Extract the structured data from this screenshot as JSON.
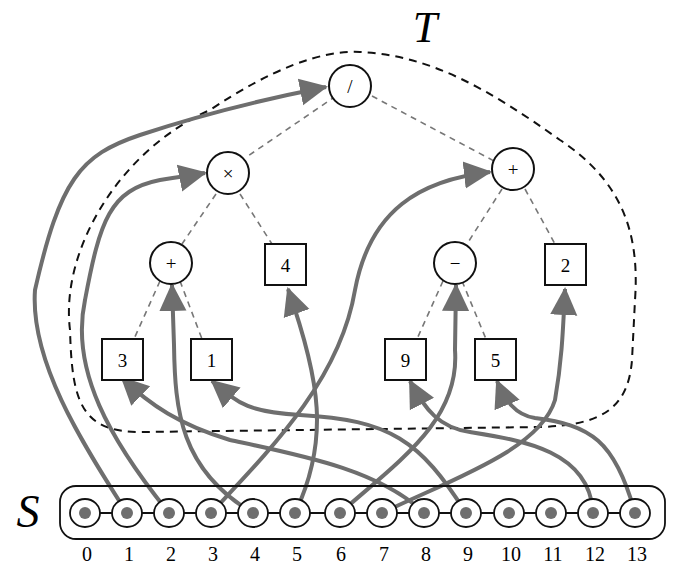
{
  "labels": {
    "tree": "T",
    "sequence": "S"
  },
  "colors": {
    "mapping_arrow": "#6e6e6e",
    "outline": "#111111",
    "tree_edge": "#777777"
  },
  "tree": {
    "root": {
      "symbol": "/",
      "type": "operator",
      "children": [
        "times",
        "plus_right"
      ]
    },
    "times": {
      "symbol": "×",
      "type": "operator",
      "children": [
        "plus_left",
        "leaf_4"
      ]
    },
    "plus_right": {
      "symbol": "+",
      "type": "operator",
      "children": [
        "minus",
        "leaf_2"
      ]
    },
    "plus_left": {
      "symbol": "+",
      "type": "operator",
      "children": [
        "leaf_3",
        "leaf_1"
      ]
    },
    "minus": {
      "symbol": "−",
      "type": "operator",
      "children": [
        "leaf_9",
        "leaf_5"
      ]
    },
    "leaf_4": {
      "symbol": "4",
      "type": "operand"
    },
    "leaf_2": {
      "symbol": "2",
      "type": "operand"
    },
    "leaf_3": {
      "symbol": "3",
      "type": "operand"
    },
    "leaf_1": {
      "symbol": "1",
      "type": "operand"
    },
    "leaf_9": {
      "symbol": "9",
      "type": "operand"
    },
    "leaf_5": {
      "symbol": "5",
      "type": "operand"
    }
  },
  "sequence": {
    "indices": [
      "0",
      "1",
      "2",
      "3",
      "4",
      "5",
      "6",
      "7",
      "8",
      "9",
      "10",
      "11",
      "12",
      "13"
    ]
  },
  "mappings": [
    {
      "from_index": 1,
      "to_node": "root"
    },
    {
      "from_index": 2,
      "to_node": "times"
    },
    {
      "from_index": 3,
      "to_node": "plus_right"
    },
    {
      "from_index": 4,
      "to_node": "plus_left"
    },
    {
      "from_index": 5,
      "to_node": "leaf_4"
    },
    {
      "from_index": 6,
      "to_node": "minus"
    },
    {
      "from_index": 7,
      "to_node": "leaf_2"
    },
    {
      "from_index": 8,
      "to_node": "leaf_3"
    },
    {
      "from_index": 9,
      "to_node": "leaf_1"
    },
    {
      "from_index": 12,
      "to_node": "leaf_9"
    },
    {
      "from_index": 13,
      "to_node": "leaf_5"
    }
  ]
}
